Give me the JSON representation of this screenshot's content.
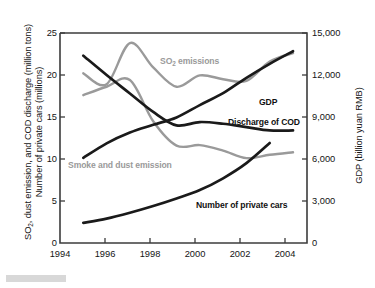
{
  "figure": {
    "kind": "line-chart",
    "background": "#ffffff"
  },
  "axes": {
    "left_title_line1": "SO₂, dust emission, and COD discharge (million tons)",
    "left_title_line2": "Number of private cars (millions)",
    "right_title": "GDP (billion yuan RMB)",
    "left_ticks": [
      "0",
      "5",
      "10",
      "15",
      "20",
      "25"
    ],
    "right_ticks": [
      "0",
      "3,000",
      "6,000",
      "9,000",
      "12,000",
      "15,000"
    ],
    "x_ticks": [
      "1994",
      "1996",
      "1998",
      "2000",
      "2002",
      "2004"
    ]
  },
  "series_labels": {
    "so2": "SO₂ emissions",
    "smoke": "Smoke and dust emission",
    "gdp": "GDP",
    "cod": "Discharge of COD",
    "cars": "Number of private cars"
  },
  "colors": {
    "gray_series": "#9a9a9a",
    "black_series": "#1a1a1a",
    "axis": "#3c3c3c",
    "text": "#141414"
  },
  "chart_data": {
    "type": "line",
    "title": "",
    "xlabel": "",
    "ylabel": "SO2, dust emission, and COD discharge (million tons) / Number of private cars (millions)",
    "y2label": "GDP (billion yuan RMB)",
    "xlim": [
      1994,
      2004.6
    ],
    "ylim": [
      0,
      25
    ],
    "y2lim": [
      0,
      15000
    ],
    "grid": false,
    "legend": "inline-annotations",
    "x_tick_values": [
      1994,
      1996,
      1998,
      2000,
      2002,
      2004
    ],
    "y_tick_values": [
      0,
      5,
      10,
      15,
      20,
      25
    ],
    "y2_tick_values": [
      0,
      3000,
      6000,
      9000,
      12000,
      15000
    ],
    "series": [
      {
        "name": "SO₂ emissions",
        "color": "#9a9a9a",
        "axis": "left",
        "units": "million tons",
        "x": [
          1995,
          1996,
          1997,
          1998,
          1999,
          2000,
          2001,
          2002,
          2003,
          2004
        ],
        "values": [
          20.2,
          18.9,
          23.8,
          20.9,
          18.6,
          19.95,
          19.5,
          19.3,
          21.6,
          22.6
        ]
      },
      {
        "name": "Smoke and dust emission",
        "color": "#9a9a9a",
        "axis": "left",
        "units": "million tons",
        "x": [
          1995,
          1996,
          1997,
          1998,
          1999,
          2000,
          2001,
          2002,
          2003,
          2004
        ],
        "values": [
          17.6,
          18.6,
          19.4,
          14.5,
          11.6,
          11.65,
          11.0,
          10.1,
          10.5,
          10.8
        ]
      },
      {
        "name": "GDP",
        "color": "#1a1a1a",
        "axis": "right",
        "units": "billion yuan RMB",
        "x": [
          1995,
          1996,
          1997,
          1998,
          1999,
          2000,
          2001,
          2002,
          2003,
          2004
        ],
        "values": [
          6080,
          7120,
          7890,
          8440,
          8970,
          9850,
          10700,
          11800,
          12800,
          13700
        ],
        "left_equivalent": [
          10.1,
          11.85,
          13.15,
          14.05,
          14.95,
          16.4,
          17.8,
          19.6,
          21.3,
          22.7
        ]
      },
      {
        "name": "Discharge of COD",
        "color": "#1a1a1a",
        "axis": "left",
        "units": "million tons",
        "x": [
          1995,
          1996,
          1997,
          1998,
          1999,
          2000,
          2001,
          2002,
          2003,
          2004
        ],
        "values": [
          22.3,
          20.0,
          17.8,
          15.6,
          14.0,
          14.4,
          14.2,
          13.8,
          13.4,
          13.4
        ]
      },
      {
        "name": "Number of private cars",
        "color": "#1a1a1a",
        "axis": "left",
        "units": "millions",
        "x": [
          1995,
          1996,
          1997,
          1998,
          1999,
          2000,
          2001,
          2002,
          2003
        ],
        "values": [
          2.4,
          2.9,
          3.6,
          4.4,
          5.3,
          6.3,
          7.7,
          9.5,
          11.9
        ]
      }
    ]
  }
}
